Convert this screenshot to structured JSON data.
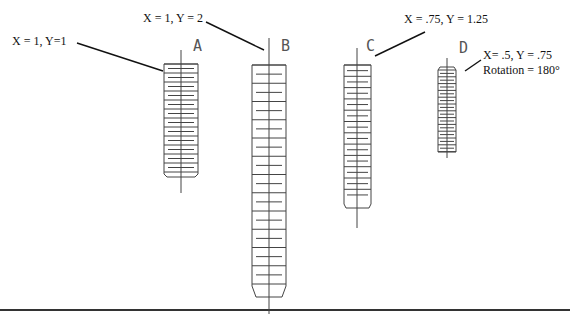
{
  "diagram": {
    "items": [
      {
        "letter": "A",
        "caption": "X = 1, Y=1"
      },
      {
        "letter": "B",
        "caption": "X = 1, Y = 2"
      },
      {
        "letter": "C",
        "caption": "X = .75, Y = 1.25"
      },
      {
        "letter": "D",
        "caption_line1": "X= .5, Y =  .75",
        "caption_line2": "Rotation = 180°"
      }
    ],
    "colors": {
      "stroke": "#444444",
      "leader": "#111111",
      "ground": "#333333"
    }
  }
}
